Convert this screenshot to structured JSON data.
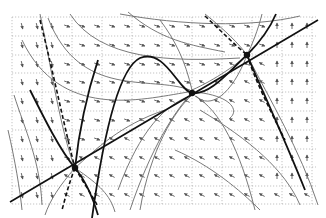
{
  "diagram": {
    "type": "phase-portrait",
    "colors": {
      "background": "#ffffff",
      "grid": "#9a9a9a",
      "arrow": "#555555",
      "trajectory": "#6a6a6a",
      "thick": "#111111"
    },
    "plot_area": {
      "x0": 12,
      "y0": 17,
      "x1": 316,
      "y1": 204
    },
    "grid": {
      "vertical_x": [
        12,
        42,
        72,
        102,
        132,
        162,
        192,
        222,
        252,
        282,
        312
      ],
      "horizontal_y": [
        17,
        36,
        55,
        73,
        92,
        111,
        130,
        149,
        167,
        186,
        204
      ]
    },
    "critical_points": [
      {
        "name": "lower-left-node",
        "x": 75,
        "y": 168
      },
      {
        "name": "center-point",
        "x": 192,
        "y": 93
      },
      {
        "name": "upper-right-node",
        "x": 247,
        "y": 55
      }
    ],
    "straight_line": {
      "x1": 10,
      "y1": 202,
      "x2": 318,
      "y2": 20
    },
    "thick_curves": [
      "M 92 218 C 100 160, 115 70, 140 58 C 165 48, 178 90, 192 93 C 210 96, 230 70, 247 55 C 260 42, 270 28, 276 14",
      "M 30 90 C 45 120, 60 150, 75 168 C 85 180, 92 195, 98 215",
      "M 247 55 C 262 90, 285 140, 305 190",
      "M 75 168 C 78 140, 85 100, 98 60"
    ],
    "thin_curves": [
      "M 128 12 C 160 40, 190 45, 225 52",
      "M 70 14 C 100 60, 170 62, 240 58",
      "M 48 18 C 80 100, 150 75, 190 90",
      "M 22 40 C 60 120, 140 100, 188 92",
      "M 300 16 C 250 28, 180 25, 120 14",
      "M 190 96 C 165 105, 140 130, 118 190",
      "M 192 95 C 175 110, 150 150, 140 210",
      "M 192 90 C 215 80, 240 62, 247 55",
      "M 195 96 C 220 110, 240 150, 255 210",
      "M 194 92 C 230 95, 240 110, 230 118",
      "M 205 14 C 225 30, 240 45, 247 55",
      "M 247 55 C 232 95, 210 110, 196 96",
      "M 262 14 C 258 30, 252 45, 247 55",
      "M 247 55 C 270 100, 300 150, 318 205",
      "M 200 110 C 250 140, 285 170, 300 205",
      "M 175 150 C 210 165, 240 190, 260 210",
      "M 75 168 C 95 150, 120 125, 165 110",
      "M 75 168 C 60 185, 50 200, 45 215",
      "M 75 168 C 100 185, 110 195, 115 212",
      "M 40 14 C 50 60, 60 130, 75 168",
      "M 14 95 C 25 130, 40 160, 42 205",
      "M 8 130 C 15 160, 20 190, 22 210",
      "M 160 20 C 175 40, 185 60, 192 90",
      "M 130 210 C 150 150, 175 110, 192 93"
    ],
    "dashed_curves": [
      "M 205 16 C 220 30, 235 45, 247 55",
      "M 247 55 C 255 80, 270 110, 285 140",
      "M 75 168 C 70 180, 66 195, 62 210",
      "M 75 168 C 85 185, 92 195, 97 205",
      "M 40 20 C 55 80, 65 130, 75 168"
    ],
    "arrow_field": {
      "columns_x": [
        22,
        37,
        52,
        67,
        82,
        97,
        112,
        127,
        142,
        157,
        172,
        187,
        202,
        217,
        232,
        247,
        262,
        277,
        292,
        307
      ],
      "rows_y": [
        26,
        45,
        64,
        82,
        101,
        120,
        139,
        158,
        176,
        195
      ]
    }
  }
}
